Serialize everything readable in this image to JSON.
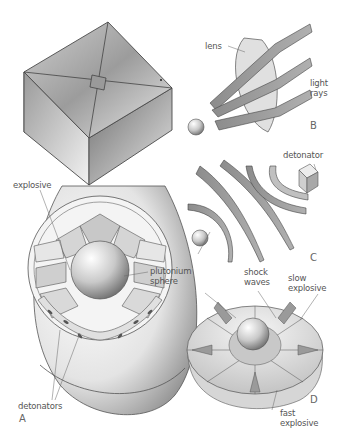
{
  "figure": {
    "panels": [
      {
        "id": "A",
        "label": "A",
        "subject": "bomb assembly cutaway"
      },
      {
        "id": "B",
        "label": "B",
        "subject": "lens focusing light rays"
      },
      {
        "id": "C",
        "label": "C",
        "subject": "shock waves from detonator"
      },
      {
        "id": "D",
        "label": "D",
        "subject": "explosive lens hemisphere"
      }
    ],
    "labels": {
      "explosive": "explosive",
      "plutonium_sphere_line1": "plutonium",
      "plutonium_sphere_line2": "sphere",
      "detonators": "detonators",
      "lens": "lens",
      "light_rays_line1": "light",
      "light_rays_line2": "rays",
      "detonator": "detonator",
      "shock_waves_line1": "shock",
      "shock_waves_line2": "waves",
      "slow_explosive_line1": "slow",
      "slow_explosive_line2": "explosive",
      "fast_explosive_line1": "fast",
      "fast_explosive_line2": "explosive"
    },
    "colors": {
      "line": "#4a4a4a",
      "dark_fill": "#8a8a8a",
      "mid_fill": "#b5b5b5",
      "light_fill": "#dcdcdc",
      "label_text": "#555555"
    }
  }
}
